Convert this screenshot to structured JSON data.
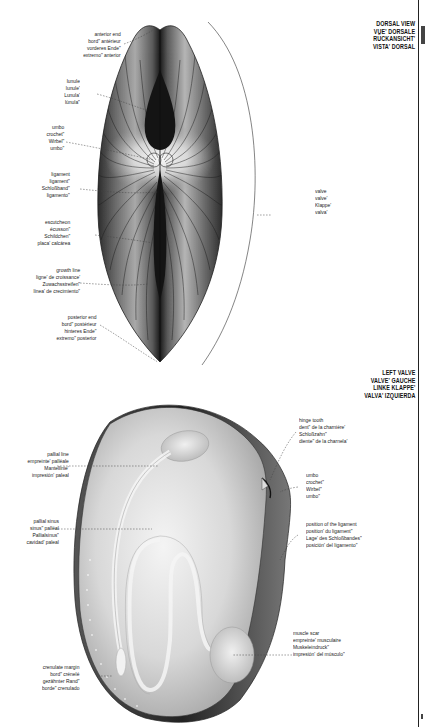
{
  "dorsal_view": {
    "title": [
      "DORSAL VIEW",
      "VUE' DORSALE",
      "RÜCKANSICHT'",
      "VISTA' DORSAL"
    ],
    "labels": {
      "anterior_end": [
        "anterior end",
        "bord\" antérieur",
        "vorderes Ende\"",
        "extremo\" anterior"
      ],
      "lunule": [
        "lunule",
        "lunule'",
        "Lunula'",
        "lúnula\""
      ],
      "umbo": [
        "umbo",
        "crochet\"",
        "Wirbel\"",
        "umbo\""
      ],
      "ligament": [
        "ligament",
        "ligament\"",
        "Schloßband\"",
        "ligamento\""
      ],
      "escutcheon": [
        "escutcheon",
        "écusson\"",
        "Schildchen\"",
        "placa' calcárea"
      ],
      "growth_line": [
        "growth line",
        "ligne' de croissance'",
        "Zuwachsstreifen\"",
        "línea' de crecimiento\""
      ],
      "posterior_end": [
        "posterior end",
        "bord\" postérieur",
        "hinteres Ende\"",
        "extremo\" posterior"
      ],
      "valve": [
        "valve",
        "valve'",
        "Klappe'",
        "valva'"
      ]
    }
  },
  "left_valve": {
    "title": [
      "LEFT VALVE",
      "VALVE' GAUCHE",
      "LINKE KLAPPE'",
      "VALVA' IZQUIERDA"
    ],
    "labels": {
      "hinge_tooth": [
        "hinge tooth",
        "dent\" de la charnière'",
        "Schloßzahn\"",
        "diente\" de la charnela'"
      ],
      "umbo": [
        "umbo",
        "crochet\"",
        "Wirbel\"",
        "umbo\""
      ],
      "ligament_position": [
        "position of the ligament",
        "position' du ligament\"",
        "Lage' des Schloßbandes\"",
        "posición' del ligamento\""
      ],
      "muscle_scar": [
        "muscle scar",
        "empreinte' musculaire",
        "Muskeleindruck\"",
        "impresión' del músculo\""
      ],
      "pallial_line": [
        "pallial line",
        "empreinte' palléale",
        "Mantellinie'",
        "impresión' paleal"
      ],
      "pallial_sinus": [
        "pallial sinus",
        "sinus\" palléal",
        "Pallialsinus\"",
        "cavidad' paleal"
      ],
      "crenulate_margin": [
        "crenulate margin",
        "bord\" crénelé",
        "gezähnter Rand\"",
        "borde\" crenulado"
      ]
    }
  },
  "colors": {
    "shell_dark": "#2a2a2a",
    "shell_mid": "#8a8a8a",
    "shell_light": "#e8e8e8",
    "leader_line": "#444444",
    "text": "#1a1a1a"
  }
}
